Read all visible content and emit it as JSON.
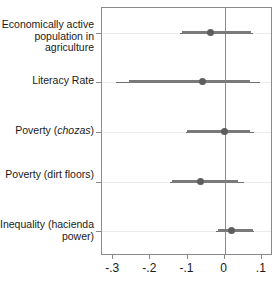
{
  "chart_data": {
    "type": "scatter",
    "title": "",
    "subtitle": "",
    "xlabel": "",
    "ylabel": "",
    "xlim": [
      -0.33,
      0.13
    ],
    "xticks": [
      -0.3,
      -0.2,
      -0.1,
      0,
      0.1
    ],
    "xticklabels": [
      "-.3",
      "-.2",
      "-.1",
      "0",
      ".1"
    ],
    "grid": true,
    "legend_position": "none",
    "reference_line": 0,
    "categories": [
      "Economically active population in agriculture",
      "Literacy Rate",
      "Poverty (chozas)",
      "Poverty (dirt floors)",
      "Inequality (hacienda power)"
    ],
    "category_labels_html": [
      "Economically active population in agriculture",
      "Literacy Rate",
      "Poverty (<i>chozas</i>)",
      "Poverty (dirt floors)",
      "Inequality (hacienda power)"
    ],
    "points": [
      {
        "label": "Economically active population in agriculture",
        "estimate": -0.037,
        "ci_inner_low": -0.115,
        "ci_inner_high": 0.07,
        "ci_outer_low": -0.12,
        "ci_outer_high": 0.075
      },
      {
        "label": "Literacy Rate",
        "estimate": -0.06,
        "ci_inner_low": -0.258,
        "ci_inner_high": 0.068,
        "ci_outer_low": -0.292,
        "ci_outer_high": 0.095
      },
      {
        "label": "Poverty (chozas)",
        "estimate": 0.0,
        "ci_inner_low": -0.102,
        "ci_inner_high": 0.068,
        "ci_outer_low": -0.105,
        "ci_outer_high": 0.08
      },
      {
        "label": "Poverty (dirt floors)",
        "estimate": -0.066,
        "ci_inner_low": -0.142,
        "ci_inner_high": 0.037,
        "ci_outer_low": -0.148,
        "ci_outer_high": 0.052
      },
      {
        "label": "Inequality (hacienda power)",
        "estimate": 0.018,
        "ci_inner_low": -0.018,
        "ci_inner_high": 0.075,
        "ci_outer_low": -0.022,
        "ci_outer_high": 0.078
      }
    ]
  },
  "colors": {
    "marker": "#5d5d5d",
    "ci_bar": "#7a7a7a",
    "whisker": "#6e6e6e",
    "frame": "#8a8a8a",
    "gridline": "#eceaea",
    "background": "#ffffff",
    "text": "#1a1a1a"
  },
  "axis": {
    "x_tick_labels": [
      "-.3",
      "-.2",
      "-.1",
      "0",
      ".1"
    ]
  }
}
